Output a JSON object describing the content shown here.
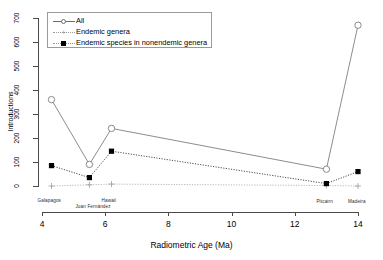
{
  "chart_data": {
    "type": "line",
    "title": "",
    "xlabel": "Radiometric Age (Ma)",
    "ylabel": "Introductions",
    "xlim": [
      4,
      14
    ],
    "ylim": [
      0,
      700
    ],
    "xticks": [
      4,
      6,
      8,
      10,
      12,
      14
    ],
    "yticks": [
      0,
      100,
      200,
      300,
      400,
      500,
      600,
      700
    ],
    "grid": false,
    "legend_position": "top-left",
    "point_labels": [
      "Galapagos",
      "Juan Fernández",
      "Hawaii",
      "Pitcairn",
      "Madeira"
    ],
    "x": [
      4.3,
      5.5,
      6.2,
      13.0,
      14.0
    ],
    "series": [
      {
        "name": "All",
        "marker": "open-circle",
        "line": "solid",
        "color": "#6e6e6e",
        "values": [
          360,
          90,
          240,
          70,
          670
        ]
      },
      {
        "name": "Endemic genera",
        "marker": "plus",
        "line": "dotted",
        "color": "#9a9a9a",
        "values": [
          0,
          5,
          8,
          2,
          0
        ]
      },
      {
        "name": "Endemic species in nonendemic genera",
        "marker": "filled-square",
        "line": "dotted",
        "color": "#000000",
        "values": [
          85,
          35,
          145,
          10,
          60
        ]
      }
    ]
  },
  "axes": {
    "y_tick_labels": [
      "0",
      "100",
      "200",
      "300",
      "400",
      "500",
      "600",
      "700"
    ],
    "x_tick_labels": [
      "4",
      "6",
      "8",
      "10",
      "12",
      "14"
    ],
    "x_title": "Radiometric Age (Ma)",
    "y_title": "Introductions"
  },
  "legend": {
    "entries": [
      {
        "label": "All",
        "marker": "open-circle"
      },
      {
        "label": "Endemic genera",
        "marker": "plus"
      },
      {
        "label": "Endemic species in nonendemic genera",
        "marker": "filled-square"
      }
    ]
  },
  "islands": [
    {
      "name": "Galapagos"
    },
    {
      "name": "Juan Fernández"
    },
    {
      "name": "Hawaii"
    },
    {
      "name": "Pitcairn"
    },
    {
      "name": "Madeira"
    }
  ],
  "colors": {
    "all_series": "#6e6e6e",
    "endemic_genera": "#9a9a9a",
    "endemic_species": "#000000",
    "axis": "#4a4a4a",
    "background": "#ffffff"
  }
}
